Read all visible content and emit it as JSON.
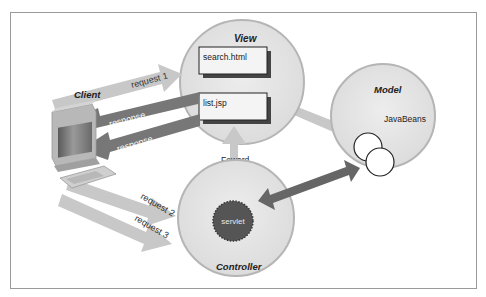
{
  "diagram": {
    "nodes": {
      "client": {
        "label": "Client"
      },
      "view": {
        "label": "View",
        "pages": [
          "search.html",
          "list.jsp"
        ]
      },
      "model": {
        "label": "Model",
        "component": "JavaBeans"
      },
      "controller": {
        "label": "Controller",
        "component": "servlet"
      }
    },
    "edges": {
      "request1": "request 1",
      "response1": "response",
      "response2": "response",
      "request2": "request 2",
      "request3": "request 3",
      "forward": "Foward"
    },
    "colors": {
      "circle_fill": "#e6e6e6",
      "circle_stroke": "#b5b5b5",
      "light_arrow": "#c8c8c8",
      "dark_arrow": "#666666",
      "servlet_fill": "#555555",
      "frame": "#9a9a9a"
    }
  }
}
